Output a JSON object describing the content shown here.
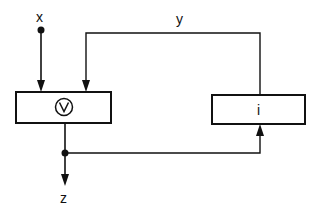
{
  "diagram": {
    "type": "block-diagram",
    "labels": {
      "input": "x",
      "feedback": "y",
      "output": "z"
    },
    "blocks": [
      {
        "id": "or-block",
        "symbol": "∨",
        "description": "OR gate (circled V)"
      },
      {
        "id": "i-block",
        "label": "i"
      }
    ],
    "connections": [
      {
        "from": "x",
        "to": "or-block"
      },
      {
        "from": "i-block",
        "to": "or-block",
        "label": "y"
      },
      {
        "from": "or-block",
        "to": "z"
      },
      {
        "from": "or-block-output-junction",
        "to": "i-block"
      }
    ],
    "colors": {
      "stroke": "#111111",
      "background": "#ffffff"
    }
  }
}
